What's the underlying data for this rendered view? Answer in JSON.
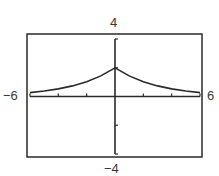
{
  "window_labels": {
    "ymax": "4",
    "ymin": "−4",
    "xmin": "−6",
    "xmax": "6"
  },
  "chart_data": {
    "type": "line",
    "title": "",
    "xlabel": "",
    "ylabel": "",
    "xlim": [
      -6,
      6
    ],
    "ylim": [
      -4,
      4
    ],
    "x_tick_step": 2,
    "y_tick_step": 2,
    "grid": false,
    "legend": null,
    "series": [
      {
        "name": "f(x)",
        "x": [
          -6,
          -5,
          -4,
          -3,
          -2,
          -1,
          0,
          1,
          2,
          3,
          4,
          5,
          6
        ],
        "values": [
          0.27,
          0.38,
          0.53,
          0.74,
          1.03,
          1.43,
          2.0,
          1.43,
          1.03,
          0.74,
          0.53,
          0.38,
          0.27
        ]
      }
    ],
    "colors": {
      "frame": "#2a2a2a",
      "axes": "#2a2a2a",
      "curve": "#2a2a2a"
    }
  }
}
